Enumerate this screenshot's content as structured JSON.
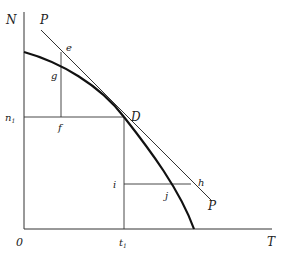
{
  "diagram": {
    "type": "production-possibility-curve-with-tangent",
    "axes": {
      "y_label": "N",
      "x_label": "T",
      "origin_label": "0"
    },
    "tick_labels": {
      "n1": "n",
      "n1_sub": "1",
      "t1": "t",
      "t1_sub": "1"
    },
    "point_labels": {
      "P_top": "P",
      "P_bottom": "P",
      "D": "D",
      "e": "e",
      "g": "g",
      "f": "f",
      "i": "i",
      "h": "h",
      "j": "j"
    },
    "colors": {
      "curve": "#111111",
      "lines": "#333333",
      "text": "#222222",
      "background": "#ffffff"
    }
  }
}
